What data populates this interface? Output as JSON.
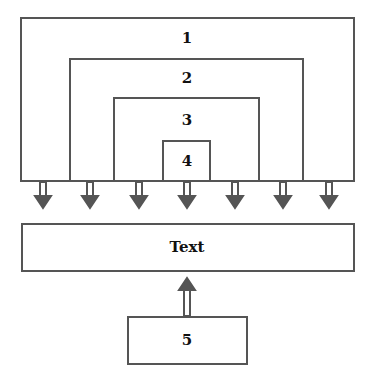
{
  "diagram": {
    "layers": [
      {
        "label": "1"
      },
      {
        "label": "2"
      },
      {
        "label": "3"
      },
      {
        "label": "4"
      }
    ],
    "target": {
      "label": "Text"
    },
    "source": {
      "label": "5"
    },
    "arrow_color": "#555555",
    "border_color": "#555555"
  }
}
